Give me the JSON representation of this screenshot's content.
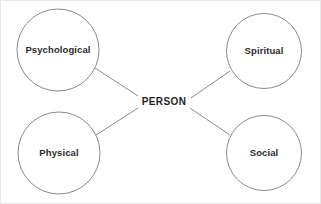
{
  "diagram": {
    "title": "PERSON",
    "type": "concept-map",
    "canvas": {
      "width": 321,
      "height": 204,
      "background": "#ffffff"
    },
    "style": {
      "stroke_color": "#8a8a8a",
      "text_color": "#2b2b2b",
      "center_text_color": "#1f1f1f",
      "fill_color": "#ffffff",
      "border_color": "#e8e8e8"
    },
    "center": {
      "label": "PERSON",
      "x": 163,
      "y": 101
    },
    "nodes": [
      {
        "id": "psychological",
        "label": "Psychological",
        "cx": 57,
        "cy": 49,
        "r": 41,
        "position": "top-left"
      },
      {
        "id": "spiritual",
        "label": "Spiritual",
        "cx": 263,
        "cy": 50,
        "r": 37.5,
        "position": "top-right"
      },
      {
        "id": "physical",
        "label": "Physical",
        "cx": 58,
        "cy": 152,
        "r": 41,
        "position": "bottom-left"
      },
      {
        "id": "social",
        "label": "Social",
        "cx": 263,
        "cy": 152,
        "r": 37.5,
        "position": "bottom-right"
      }
    ],
    "connectors": [
      {
        "id": "psychological-to-person",
        "from": "psychological",
        "to": "center",
        "x1": 94,
        "y1": 67,
        "x2": 137,
        "y2": 95
      },
      {
        "id": "spiritual-to-person",
        "from": "spiritual",
        "to": "center",
        "x1": 190,
        "y1": 97,
        "x2": 229,
        "y2": 70
      },
      {
        "id": "physical-to-person",
        "from": "physical",
        "to": "center",
        "x1": 95,
        "y1": 134,
        "x2": 137,
        "y2": 107
      },
      {
        "id": "social-to-person",
        "from": "social",
        "to": "center",
        "x1": 189,
        "y1": 107,
        "x2": 229,
        "y2": 134
      }
    ]
  }
}
